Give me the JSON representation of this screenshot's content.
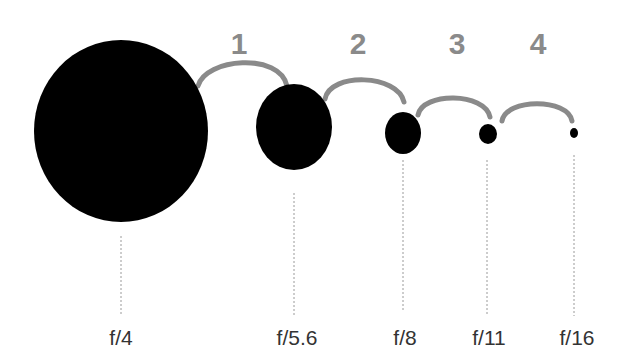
{
  "diagram": {
    "title": "",
    "colors": {
      "background": "#ffffff",
      "aperture": "#000000",
      "arc": "#8a8a8a",
      "step_number": "#8a8a8a",
      "dashed_line": "#9a9a9a",
      "label": "#333333"
    },
    "apertures": [
      {
        "label": "f/4",
        "cx": 121,
        "cy": 131,
        "rx": 87,
        "ry": 91
      },
      {
        "label": "f/5.6",
        "cx": 294,
        "cy": 127,
        "rx": 38,
        "ry": 43
      },
      {
        "label": "f/8",
        "cx": 403,
        "cy": 133,
        "rx": 18,
        "ry": 21
      },
      {
        "label": "f/11",
        "cx": 488,
        "cy": 134,
        "rx": 9,
        "ry": 10
      },
      {
        "label": "f/16",
        "cx": 574,
        "cy": 133,
        "rx": 4,
        "ry": 5
      }
    ],
    "steps": [
      {
        "number": "1"
      },
      {
        "number": "2"
      },
      {
        "number": "3"
      },
      {
        "number": "4"
      }
    ]
  }
}
